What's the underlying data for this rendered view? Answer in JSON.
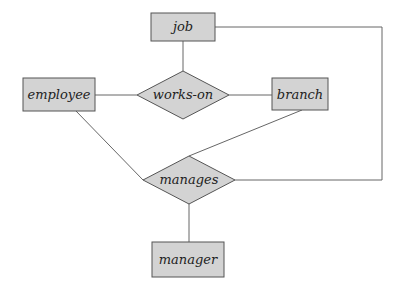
{
  "diagram": {
    "type": "er-diagram",
    "entities": [
      {
        "id": "job",
        "label": "job"
      },
      {
        "id": "employee",
        "label": "employee"
      },
      {
        "id": "branch",
        "label": "branch"
      },
      {
        "id": "manager",
        "label": "manager"
      }
    ],
    "relationships": [
      {
        "id": "works-on",
        "label": "works-on",
        "connects": [
          "job",
          "employee",
          "branch"
        ]
      },
      {
        "id": "manages",
        "label": "manages",
        "connects": [
          "employee",
          "branch",
          "job",
          "manager"
        ]
      }
    ],
    "colors": {
      "fill": "#d3d3d3",
      "stroke": "#555555",
      "line": "#666666"
    }
  }
}
